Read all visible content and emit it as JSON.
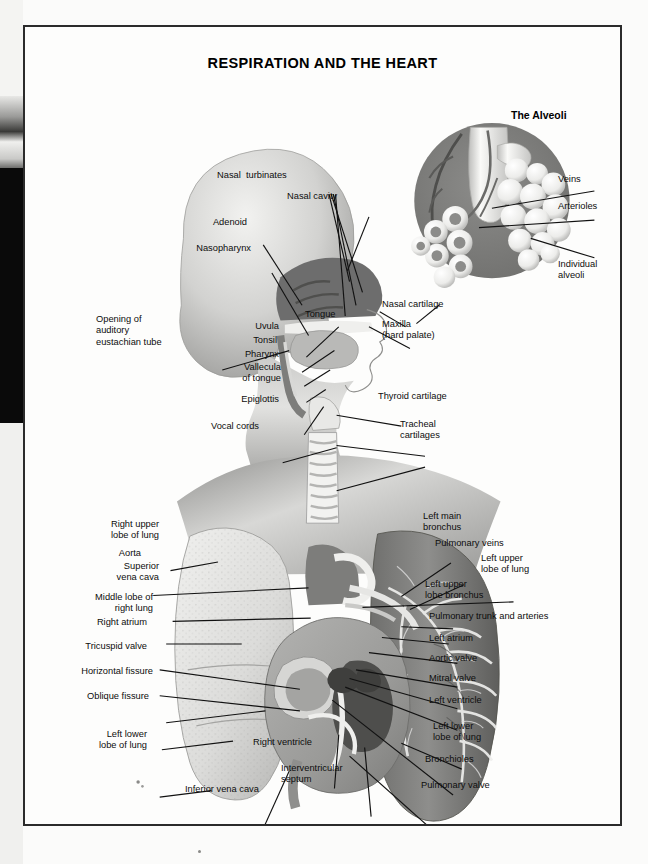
{
  "page": {
    "title": "RESPIRATION AND THE HEART",
    "plate": "PLATE 5"
  },
  "inset": {
    "title": "The Alveoli",
    "labels": {
      "veins": "Veins",
      "arterioles": "Arterioles",
      "individual_alveoli": "Individual\nalveoli"
    }
  },
  "head_labels": {
    "nasal_turbinates": "Nasal  turbinates",
    "nasal_cavity": "Nasal cavity",
    "adenoid": "Adenoid",
    "nasopharynx": "Nasopharynx",
    "opening_auditory": "Opening of\nauditory\neustachian tube",
    "uvula": "Uvula",
    "tonsil": "Tonsil",
    "pharynx": "Pharynx",
    "vallecula": "Vallecula\nof tongue",
    "epiglottis": "Epiglottis",
    "vocal_cords": "Vocal cords",
    "tongue": "Tongue",
    "nasal_cartilage": "Nasal cartilage",
    "maxilla": "Maxilla\n(hard palate)",
    "thyroid_cartilage": "Thyroid cartilage",
    "tracheal_cartilages": "Tracheal\ncartilages"
  },
  "thorax_labels_left": {
    "right_upper_lobe": "Right upper\nlobe of lung",
    "aorta": "Aorta",
    "superior_vena_cava": "Superior\nvena cava",
    "middle_lobe": "Middle lobe of\nright lung",
    "right_atrium": "Right atrium",
    "tricuspid_valve": "Tricuspid valve",
    "horizontal_fissure": "Horizontal fissure",
    "oblique_fissure": "Oblique fissure",
    "left_lower_lobe": "Left lower\nlobe of lung"
  },
  "thorax_labels_right": {
    "left_main_bronchus": "Left main\nbronchus",
    "pulmonary_veins": "Pulmonary veins",
    "left_upper_lobe": "Left upper\nlobe of lung",
    "left_upper_lobe_bronchus": "Left upper\nlobe bronchus",
    "pulmonary_trunk": "Pulmonary trunk and arteries",
    "left_atrium": "Left atrium",
    "aortic_valve": "Aortic valve",
    "mitral_valve": "Mitral valve",
    "left_ventricle": "Left ventricle",
    "left_lower_lobe": "Left lower\nlobe of lung",
    "bronchioles": "Bronchioles",
    "pulmonary_valve": "Pulmonary valve"
  },
  "thorax_labels_bottom": {
    "inferior_vena_cava": "Inferior vena cava",
    "right_ventricle": "Right ventricle",
    "interventricular_septum": "Interventricular\nseptum"
  },
  "colors": {
    "ink": "#0d0d0d",
    "border": "#2b2b2b",
    "inset_circle": "#808080",
    "paper": "#fdfdfc",
    "cavity_dark": "#6d6d6d",
    "lung_dark": "#8c8c8c",
    "lung_light": "#dcdcda"
  }
}
